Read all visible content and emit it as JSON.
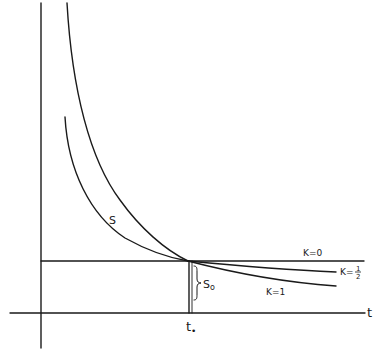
{
  "diagram": {
    "type": "line-sketch",
    "axes": {
      "x_label": "t",
      "x_marker": "t",
      "x_marker_subscript": "•"
    },
    "curves": [
      {
        "name": "outer-curve",
        "description": "steep decreasing curve from top converging at t0"
      },
      {
        "name": "S",
        "label": "S",
        "description": "curve labeled S converging at t0"
      },
      {
        "name": "K0",
        "label": "K=0",
        "description": "horizontal line at level S0"
      },
      {
        "name": "K_half",
        "label": "K=",
        "label_fraction_num": "1",
        "label_fraction_den": "2"
      },
      {
        "name": "K1",
        "label": "K=1"
      }
    ],
    "annotations": {
      "s0_label": "S",
      "s0_subscript": "o",
      "curve_s_label": "S"
    }
  },
  "labels": {
    "t_axis": "t",
    "t0_base": "t",
    "t0_sub": "•",
    "s_curve": "S",
    "s0_base": "S",
    "s0_sub": "o",
    "k0": "K=0",
    "khalf_prefix": "K=",
    "khalf_num": "1",
    "khalf_den": "2",
    "k1": "K=1"
  }
}
